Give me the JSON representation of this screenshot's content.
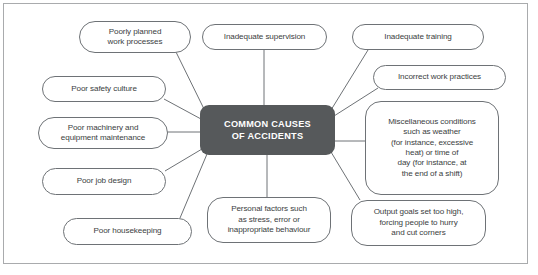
{
  "diagram": {
    "title": "COMMON CAUSES OF ACCIDENTS",
    "hub": {
      "line1": "COMMON CAUSES",
      "line2": "OF ACCIDENTS",
      "fill": "#56595b",
      "text_color": "#ffffff"
    },
    "frame": {
      "border_color": "#a9abad"
    },
    "node_style": {
      "border_color": "#6e7276",
      "fill": "#ffffff",
      "text_color": "#3b3e41"
    },
    "nodes": [
      {
        "id": "poorly-planned-work-processes",
        "lines": [
          "Poorly planned",
          "work processes"
        ],
        "x": 79,
        "y": 21,
        "w": 112,
        "h": 32
      },
      {
        "id": "inadequate-supervision",
        "lines": [
          "Inadequate supervision"
        ],
        "x": 202,
        "y": 24,
        "w": 125,
        "h": 26
      },
      {
        "id": "inadequate-training",
        "lines": [
          "Inadequate training"
        ],
        "x": 352,
        "y": 24,
        "w": 132,
        "h": 26
      },
      {
        "id": "poor-safety-culture",
        "lines": [
          "Poor safety culture"
        ],
        "x": 42,
        "y": 76,
        "w": 124,
        "h": 26
      },
      {
        "id": "incorrect-work-practices",
        "lines": [
          "Incorrect work practices"
        ],
        "x": 373,
        "y": 65,
        "w": 133,
        "h": 25
      },
      {
        "id": "poor-machinery-and-equipment-maintenance",
        "lines": [
          "Poor machinery and",
          "equipment maintenance"
        ],
        "x": 38,
        "y": 117,
        "w": 130,
        "h": 32
      },
      {
        "id": "miscellaneous-conditions",
        "lines": [
          "Miscellaneous conditions",
          "such as weather",
          "(for instance, excessive",
          "heat) or time of",
          "day (for instance, at",
          "the end of a shift)"
        ],
        "x": 365,
        "y": 101,
        "w": 134,
        "h": 94
      },
      {
        "id": "poor-job-design",
        "lines": [
          "Poor job design"
        ],
        "x": 42,
        "y": 168,
        "w": 124,
        "h": 27
      },
      {
        "id": "personal-factors",
        "lines": [
          "Personal factors such",
          "as stress, error or",
          "inappropriate behaviour"
        ],
        "x": 207,
        "y": 197,
        "w": 124,
        "h": 46
      },
      {
        "id": "output-goals-set-too-high",
        "lines": [
          "Output goals set too high,",
          "forcing people to hurry",
          "and cut corners"
        ],
        "x": 351,
        "y": 200,
        "w": 135,
        "h": 46
      },
      {
        "id": "poor-housekeeping",
        "lines": [
          "Poor housekeeping"
        ],
        "x": 63,
        "y": 218,
        "w": 129,
        "h": 27
      }
    ],
    "connectors": [
      {
        "id": "hub-to-poorly-planned-work-processes",
        "x1": 205,
        "y1": 111,
        "x2": 176,
        "y2": 52
      },
      {
        "id": "hub-to-inadequate-supervision",
        "x1": 264,
        "y1": 105,
        "x2": 264,
        "y2": 50
      },
      {
        "id": "hub-to-inadequate-training",
        "x1": 331,
        "y1": 110,
        "x2": 368,
        "y2": 50
      },
      {
        "id": "hub-to-poor-safety-culture",
        "x1": 201,
        "y1": 119,
        "x2": 164,
        "y2": 99
      },
      {
        "id": "hub-to-incorrect-work-practices",
        "x1": 334,
        "y1": 116,
        "x2": 378,
        "y2": 88
      },
      {
        "id": "hub-to-poor-machinery",
        "x1": 200,
        "y1": 132,
        "x2": 167,
        "y2": 132
      },
      {
        "id": "hub-to-miscellaneous-conditions",
        "x1": 335,
        "y1": 141,
        "x2": 366,
        "y2": 141
      },
      {
        "id": "hub-to-poor-job-design",
        "x1": 202,
        "y1": 149,
        "x2": 165,
        "y2": 171
      },
      {
        "id": "hub-to-personal-factors",
        "x1": 267,
        "y1": 155,
        "x2": 267,
        "y2": 197
      },
      {
        "id": "hub-to-output-goals",
        "x1": 331,
        "y1": 152,
        "x2": 360,
        "y2": 200
      },
      {
        "id": "hub-to-poor-housekeeping",
        "x1": 207,
        "y1": 154,
        "x2": 180,
        "y2": 218
      }
    ]
  }
}
